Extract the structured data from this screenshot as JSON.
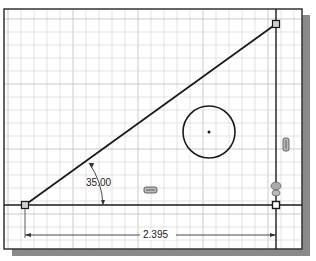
{
  "sketch": {
    "frame": {
      "x": 4,
      "y": 9,
      "width": 298,
      "height": 240,
      "border": "#333333",
      "shadow": "#8a8a8a"
    },
    "grid": {
      "minor_spacing": 13,
      "minor_color": "#dcdcdc",
      "major_color": "#bdbdbd"
    },
    "line_color": "#1a1a1a",
    "points": {
      "origin": {
        "x": 25,
        "y": 205
      },
      "top_right": {
        "x": 276,
        "y": 24
      },
      "bottom_right": {
        "x": 276,
        "y": 205
      }
    },
    "circle": {
      "cx": 209,
      "cy": 132,
      "r": 26
    },
    "dimensions": {
      "angle": {
        "label": "35.00"
      },
      "horizontal": {
        "label": "2.395"
      }
    },
    "constraints": [
      {
        "name": "horizontal-constraint-icon",
        "x": 150,
        "y": 190
      },
      {
        "name": "vertical-constraint-icon",
        "x": 286,
        "y": 144
      },
      {
        "name": "coincident-constraint-icon",
        "x": 276,
        "y": 190
      }
    ]
  }
}
